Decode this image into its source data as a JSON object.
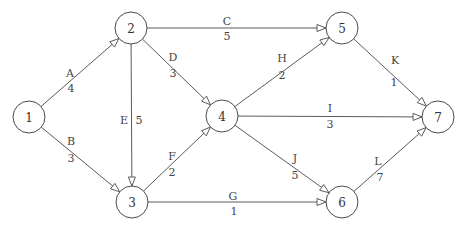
{
  "diagram": {
    "type": "activity-on-arrow network",
    "node_radius": 16,
    "colors": {
      "line": "#5a5a5a",
      "node_stroke": "#4a4a4a",
      "text": "#333333",
      "background": "#ffffff"
    },
    "nodes": [
      {
        "id": "1",
        "label": "1",
        "x": 29,
        "y": 117
      },
      {
        "id": "2",
        "label": "2",
        "x": 131,
        "y": 28
      },
      {
        "id": "3",
        "label": "3",
        "x": 132,
        "y": 202
      },
      {
        "id": "4",
        "label": "4",
        "x": 222,
        "y": 116
      },
      {
        "id": "5",
        "label": "5",
        "x": 342,
        "y": 28
      },
      {
        "id": "6",
        "label": "6",
        "x": 342,
        "y": 202
      },
      {
        "id": "7",
        "label": "7",
        "x": 438,
        "y": 117
      }
    ],
    "edges": [
      {
        "activity": "A",
        "duration": "4",
        "from": "1",
        "to": "2",
        "name_pos": [
          70,
          73
        ],
        "dur_pos": [
          71,
          88
        ]
      },
      {
        "activity": "B",
        "duration": "3",
        "from": "1",
        "to": "3",
        "name_pos": [
          71,
          141
        ],
        "dur_pos": [
          71,
          158
        ]
      },
      {
        "activity": "C",
        "duration": "5",
        "from": "2",
        "to": "5",
        "name_pos": [
          227,
          21
        ],
        "dur_pos": [
          227,
          36
        ]
      },
      {
        "activity": "D",
        "duration": "3",
        "from": "2",
        "to": "4",
        "name_pos": [
          173,
          57
        ],
        "dur_pos": [
          173,
          73
        ]
      },
      {
        "activity": "E",
        "duration": "5",
        "from": "2",
        "to": "3",
        "name_pos": [
          124,
          120
        ],
        "dur_pos": [
          139,
          120
        ]
      },
      {
        "activity": "F",
        "duration": "2",
        "from": "3",
        "to": "4",
        "name_pos": [
          172,
          156
        ],
        "dur_pos": [
          172,
          172
        ]
      },
      {
        "activity": "G",
        "duration": "1",
        "from": "3",
        "to": "6",
        "name_pos": [
          233,
          196
        ],
        "dur_pos": [
          234,
          211
        ]
      },
      {
        "activity": "H",
        "duration": "2",
        "from": "4",
        "to": "5",
        "name_pos": [
          282,
          58
        ],
        "dur_pos": [
          282,
          75
        ]
      },
      {
        "activity": "I",
        "duration": "3",
        "from": "4",
        "to": "7",
        "name_pos": [
          330,
          108
        ],
        "dur_pos": [
          330,
          124
        ]
      },
      {
        "activity": "J",
        "duration": "5",
        "from": "4",
        "to": "6",
        "name_pos": [
          295,
          158
        ],
        "dur_pos": [
          295,
          175
        ]
      },
      {
        "activity": "K",
        "duration": "1",
        "from": "5",
        "to": "7",
        "name_pos": [
          395,
          60
        ],
        "dur_pos": [
          394,
          82
        ]
      },
      {
        "activity": "L",
        "duration": "7",
        "from": "6",
        "to": "7",
        "name_pos": [
          378,
          161
        ],
        "dur_pos": [
          380,
          177
        ]
      }
    ]
  }
}
